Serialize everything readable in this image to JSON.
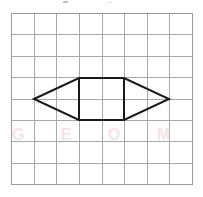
{
  "figure": {
    "title": "",
    "background_color": "#ffffff",
    "grid": {
      "columns": 8,
      "rows": 8,
      "left": 11,
      "top": 13,
      "right": 192,
      "bottom": 184,
      "cell_width": 22.6,
      "cell_height": 21.4,
      "line_color": "#a8a8a8",
      "border_color": "#9a9a9a",
      "line_width": 1
    },
    "shape": {
      "name": "hexagon",
      "stroke_color": "#1a1a1a",
      "stroke_width": 2,
      "fill": "none",
      "vertices": [
        {
          "label": "left-point",
          "x": 34,
          "y": 99
        },
        {
          "label": "top-left",
          "x": 79,
          "y": 78
        },
        {
          "label": "top-right",
          "x": 124,
          "y": 78
        },
        {
          "label": "right-point",
          "x": 169,
          "y": 99
        },
        {
          "label": "bottom-right",
          "x": 124,
          "y": 120
        },
        {
          "label": "bottom-left",
          "x": 79,
          "y": 120
        }
      ],
      "interior_segments": [
        {
          "label": "left-divider",
          "x1": 79,
          "y1": 78,
          "x2": 79,
          "y2": 120
        },
        {
          "label": "right-divider",
          "x1": 124,
          "y1": 78,
          "x2": 124,
          "y2": 120
        }
      ]
    },
    "watermark": {
      "text": "G E O M E T R Y",
      "color": "#efc9c9"
    }
  }
}
